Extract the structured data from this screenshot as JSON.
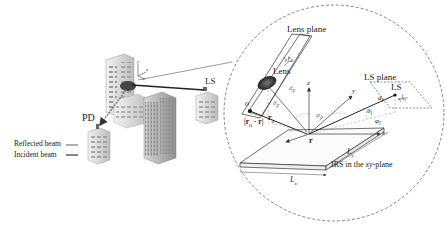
{
  "scene": {
    "labels": {
      "pd": "PD",
      "ls_left": "LS",
      "reflected_beam": "Reflected beam",
      "incident_beam": "Incident beam",
      "axis_x_small": "x",
      "axis_y_small": "y",
      "axis_z_small": "z"
    }
  },
  "inset": {
    "lens_plane": "Lens plane",
    "lens": "Lens",
    "ls_plane": "LS plane",
    "ls": "LS",
    "o_label": "o",
    "r_o": "r",
    "r_o_sub": "o",
    "r_minus": "|r",
    "r_minus_mid": "o",
    "r_minus_end": " - r|",
    "r_vec": "r",
    "d_p": "d",
    "d_p_sub": "p",
    "d_l": "d",
    "d_l_sub": "l",
    "theta_p": "θ",
    "theta_p_sub": "p",
    "phi_p": "φ",
    "phi_p_sub": "p",
    "theta_l": "θ",
    "theta_l_sub": "l",
    "phi_l": "φ",
    "phi_l_sub": "l",
    "axis_x": "x",
    "axis_y": "y",
    "axis_z": "z",
    "lens_axes": [
      "z",
      "x",
      "y"
    ],
    "lens_axes_sub": "p",
    "ls_axes": [
      "z",
      "x",
      "y"
    ],
    "ls_axes_sub": "l",
    "Lx": "L",
    "Lx_sub": "x",
    "Ly": "L",
    "Ly_sub": "y",
    "irs_label_pre": "IRS in the ",
    "irs_label_it": "xy",
    "irs_label_post": "-plane"
  }
}
